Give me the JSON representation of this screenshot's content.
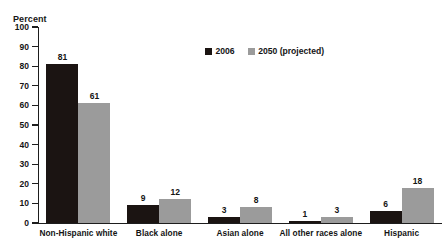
{
  "chart_data": {
    "type": "bar",
    "title": "",
    "subtitle": "",
    "xlabel": "",
    "ylabel": "Percent",
    "ylim": [
      0,
      100
    ],
    "ytick_step": 10,
    "yticks": [
      100,
      90,
      80,
      70,
      60,
      50,
      40,
      30,
      20,
      10,
      0
    ],
    "ytick_labels": [
      "100",
      "90",
      "80",
      "70",
      "60",
      "50",
      "40",
      "30",
      "20",
      "10",
      "0"
    ],
    "grid": false,
    "legend_position": "top-center",
    "categories": [
      "Non-Hispanic white",
      "Black alone",
      "Asian alone",
      "All other races alone",
      "Hispanic"
    ],
    "series": [
      {
        "name": "2006",
        "color": "#1b1412",
        "values": [
          81,
          9,
          3,
          1,
          6
        ],
        "value_labels": [
          "81",
          "9",
          "3",
          "1",
          "6"
        ]
      },
      {
        "name": "2050 (projected)",
        "color": "#9b9b9b",
        "values": [
          61,
          12,
          8,
          3,
          18
        ],
        "value_labels": [
          "61",
          "12",
          "8",
          "3",
          "18"
        ]
      }
    ]
  },
  "clipped_header_text": "",
  "axis": {
    "y_title": "Percent"
  },
  "legend": {
    "items": [
      {
        "label": "2006",
        "color": "#1b1412"
      },
      {
        "label": "2050 (projected)",
        "color": "#9b9b9b"
      }
    ]
  }
}
